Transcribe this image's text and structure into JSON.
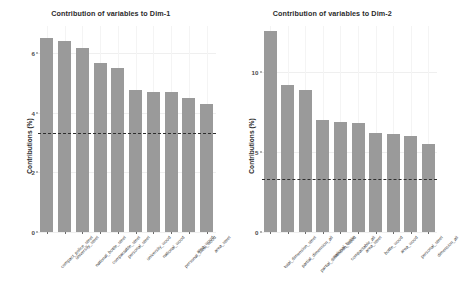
{
  "figure": {
    "background": "#ffffff",
    "bar_color": "#9a9a9a",
    "refline_color": "#2f2f2f",
    "grid_color": "#efefef"
  },
  "chart_data": [
    {
      "type": "bar",
      "title": "Contribution of variables to Dim-1",
      "xlabel": "",
      "ylabel": "Contributions (%)",
      "ylim": [
        0,
        6.9
      ],
      "yticks": [
        0,
        2,
        4,
        6
      ],
      "ytick_labels": [
        "0",
        "2",
        "4",
        "6"
      ],
      "grid": true,
      "legend": "none",
      "reference_line": 3.3,
      "categories": [
        "compact_police_steel",
        "university_steel",
        "national_bottle_steel",
        "compactable_steel",
        "personal_steel",
        "university_wood",
        "national_wood",
        "personal_steel_wood",
        "area_wood",
        "area_steel"
      ],
      "values": [
        6.5,
        6.4,
        6.15,
        5.65,
        5.5,
        4.75,
        4.7,
        4.7,
        4.5,
        4.3
      ]
    },
    {
      "type": "bar",
      "title": "Contribution of variables to Dim-2",
      "xlabel": "",
      "ylabel": "Contributions (%)",
      "ylim": [
        0,
        12.9
      ],
      "yticks": [
        0,
        5,
        10
      ],
      "ytick_labels": [
        "0",
        "5",
        "10"
      ],
      "grid": true,
      "legend": "none",
      "reference_line": 3.3,
      "categories": [
        "total_dimension_steel",
        "partial_dimension_all",
        "partial_dimension_wood",
        "national_bottle",
        "compactable_all",
        "area_steel",
        "bottle_wood",
        "area_wood",
        "personal_steel",
        "dimension_all"
      ],
      "values": [
        12.6,
        9.2,
        8.9,
        7.0,
        6.9,
        6.85,
        6.2,
        6.15,
        6.0,
        5.5
      ]
    }
  ]
}
